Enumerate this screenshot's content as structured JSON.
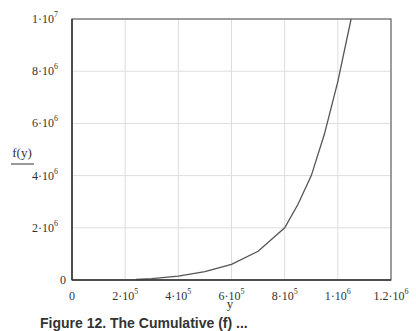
{
  "chart_data": {
    "type": "line",
    "title": "",
    "xlabel": "y",
    "ylabel": "f(y)",
    "xlim": [
      0,
      1200000
    ],
    "ylim": [
      0,
      10000000
    ],
    "grid": true,
    "legend": null,
    "x_ticks": [
      {
        "value": 0,
        "mant": "0",
        "exp": ""
      },
      {
        "value": 200000,
        "mant": "2·10",
        "exp": "5"
      },
      {
        "value": 400000,
        "mant": "4·10",
        "exp": "5"
      },
      {
        "value": 600000,
        "mant": "6·10",
        "exp": "5"
      },
      {
        "value": 800000,
        "mant": "8·10",
        "exp": "5"
      },
      {
        "value": 1000000,
        "mant": "1·10",
        "exp": "6"
      },
      {
        "value": 1200000,
        "mant": "1.2·10",
        "exp": "6"
      }
    ],
    "y_ticks": [
      {
        "value": 0,
        "mant": "0",
        "exp": ""
      },
      {
        "value": 2000000,
        "mant": "2·10",
        "exp": "6"
      },
      {
        "value": 4000000,
        "mant": "4·10",
        "exp": "6"
      },
      {
        "value": 6000000,
        "mant": "6·10",
        "exp": "6"
      },
      {
        "value": 8000000,
        "mant": "8·10",
        "exp": "6"
      },
      {
        "value": 10000000,
        "mant": "1·10",
        "exp": "7"
      }
    ],
    "series": [
      {
        "name": "f(y)",
        "color": "#555555",
        "x": [
          240000,
          300000,
          400000,
          500000,
          600000,
          700000,
          800000,
          850000,
          900000,
          950000,
          1000000,
          1050000
        ],
        "y": [
          20000,
          50000,
          150000,
          320000,
          600000,
          1100000,
          2000000,
          2900000,
          4000000,
          5600000,
          7600000,
          10000000
        ]
      }
    ]
  },
  "caption": {
    "text": "Figure 12. The Cumulative (f) ..."
  }
}
